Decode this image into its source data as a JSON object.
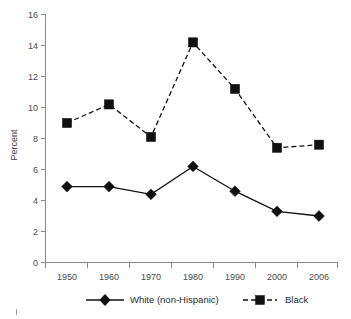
{
  "chart_data": {
    "type": "line",
    "title": "",
    "subtitle": "",
    "xlabel": "",
    "ylabel": "Percent",
    "categories": [
      "1950",
      "1960",
      "1970",
      "1980",
      "1990",
      "2000",
      "2006"
    ],
    "ylim": [
      0,
      16
    ],
    "y_ticks": [
      "0",
      "2",
      "4",
      "6",
      "8",
      "10",
      "12",
      "14",
      "16"
    ],
    "grid": false,
    "legend_position": "bottom",
    "series": [
      {
        "name": "White (non-Hispanic)",
        "marker": "diamond",
        "linestyle": "solid",
        "color": "#111111",
        "values": [
          4.9,
          4.9,
          4.4,
          6.2,
          4.6,
          3.3,
          3.0
        ]
      },
      {
        "name": "Black",
        "marker": "square",
        "linestyle": "dashed",
        "color": "#111111",
        "values": [
          9.0,
          10.2,
          8.1,
          14.2,
          11.2,
          7.4,
          7.6
        ]
      }
    ]
  },
  "axes": {
    "y_axis_label": "Percent"
  },
  "legend": {
    "items": [
      {
        "label": "White (non-Hispanic)"
      },
      {
        "label": "Black"
      }
    ]
  },
  "colors": {
    "ink": "#111111",
    "axis": "#8a8a8a",
    "tick_text": "#4a4a4a",
    "background": "#ffffff"
  }
}
